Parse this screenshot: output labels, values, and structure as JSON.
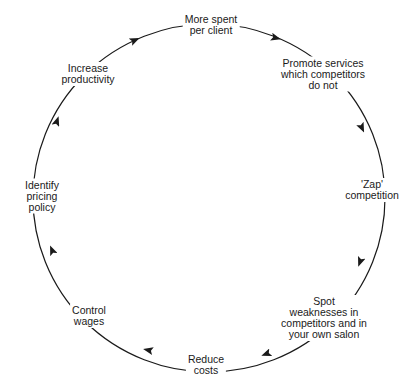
{
  "diagram": {
    "type": "cycle",
    "direction": "clockwise",
    "stroke_color": "#1a1a1a",
    "background_color": "#ffffff",
    "nodes": [
      {
        "id": "more-spent",
        "label": "More spent\nper client"
      },
      {
        "id": "promote-services",
        "label": "Promote services\nwhich competitors\ndo not"
      },
      {
        "id": "zap-competition",
        "label": "'Zap'\ncompetition"
      },
      {
        "id": "spot-weaknesses",
        "label": "Spot\nweaknesses in\ncompetitors and in\nyour own salon"
      },
      {
        "id": "reduce-costs",
        "label": "Reduce\ncosts"
      },
      {
        "id": "control-wages",
        "label": "Control\nwages"
      },
      {
        "id": "identify-pricing",
        "label": "Identify\npricing\npolicy"
      },
      {
        "id": "increase-productivity",
        "label": "Increase\nproductivity"
      }
    ]
  }
}
